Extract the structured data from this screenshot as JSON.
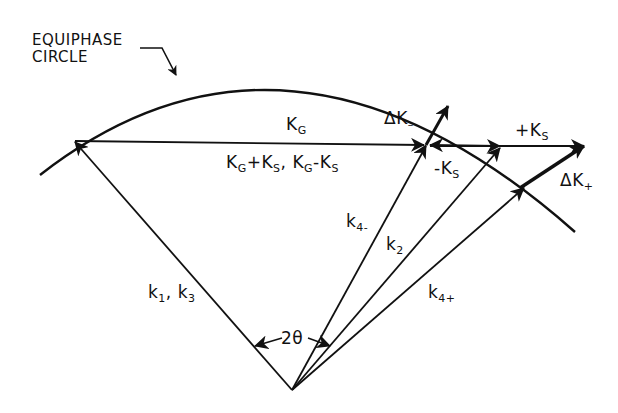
{
  "title_label": {
    "line1": "EQUIPHASE",
    "line2": "CIRCLE"
  },
  "vectors": {
    "KG": {
      "base": "K",
      "sub": "G"
    },
    "KG_combo": {
      "a_base": "K",
      "a_sub": "G",
      "plus": "+K",
      "b_sub": "S",
      "sep": ", ",
      "c_base": "K",
      "c_sub": "G",
      "minus": "-K",
      "d_sub": "S"
    },
    "dK_minus": {
      "base": "ΔK",
      "sub": "–"
    },
    "minus_KS": {
      "base": "-K",
      "sub": "S"
    },
    "plus_KS": {
      "base": "+K",
      "sub": "S"
    },
    "dK_plus": {
      "base": "ΔK",
      "sub": "+"
    },
    "k1k3": {
      "a": "k",
      "a_sub": "1",
      "sep": ", k",
      "b_sub": "3"
    },
    "k4minus": {
      "base": "k",
      "sub": "4-"
    },
    "k2": {
      "base": "k",
      "sub": "2"
    },
    "k4plus": {
      "base": "k",
      "sub": "4+"
    }
  },
  "angle": {
    "label": "2θ"
  },
  "colors": {
    "ink": "#111111",
    "background": "#ffffff"
  }
}
